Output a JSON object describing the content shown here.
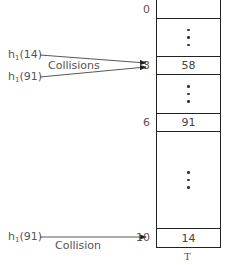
{
  "table": {
    "name": "T",
    "slots": [
      {
        "index": "0",
        "value": "",
        "top": 0,
        "height": 19
      },
      {
        "index": "",
        "value": "ellipsis",
        "top": 18,
        "height": 39
      },
      {
        "index": "3",
        "value": "58",
        "top": 56,
        "height": 19
      },
      {
        "index": "",
        "value": "ellipsis",
        "top": 74,
        "height": 40
      },
      {
        "index": "6",
        "value": "91",
        "top": 113,
        "height": 19
      },
      {
        "index": "",
        "value": "ellipsis",
        "top": 131,
        "height": 98
      },
      {
        "index": "10",
        "value": "14",
        "top": 228,
        "height": 20
      }
    ]
  },
  "labels": {
    "h14_top": {
      "func": "h",
      "sub": "1",
      "arg": "(14)"
    },
    "h91_top": {
      "func": "h",
      "sub": "1",
      "arg": "(91)"
    },
    "h91_bottom": {
      "func": "h",
      "sub": "1",
      "arg": "(91)"
    },
    "collisions": "Collisions",
    "collision": "Collision"
  },
  "indices": {
    "i0": "0",
    "i3": "3",
    "i6": "6",
    "i10": "10"
  },
  "values": {
    "v3": "58",
    "v6": "91",
    "v10": "14"
  }
}
